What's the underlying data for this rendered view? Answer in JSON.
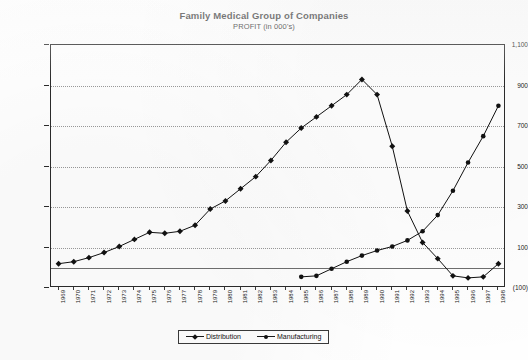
{
  "chart_data": {
    "type": "line",
    "title": "Family Medical Group of Companies",
    "subtitle": "PROFIT (in 000's)",
    "xlabel": "",
    "ylabel": "",
    "ylim": [
      -100,
      1100
    ],
    "ytick_values": [
      1100,
      900,
      700,
      500,
      300,
      100,
      -100
    ],
    "ytick_labels": [
      "1,100",
      "900",
      "700",
      "500",
      "300",
      "100",
      "(100)"
    ],
    "grid": true,
    "legend_position": "bottom-center",
    "categories": [
      "1969",
      "1970",
      "1971",
      "1972",
      "1973",
      "1974",
      "1975",
      "1976",
      "1977",
      "1978",
      "1979",
      "1980",
      "1981",
      "1982",
      "1983",
      "1984",
      "1985",
      "1986",
      "1987",
      "1988",
      "1989",
      "1990",
      "1991",
      "1992",
      "1993",
      "1994",
      "1995",
      "1996",
      "1997",
      "1998"
    ],
    "series": [
      {
        "name": "Distribution",
        "marker": "diamond",
        "color": "#111111",
        "values": [
          20,
          30,
          50,
          75,
          105,
          140,
          175,
          170,
          180,
          210,
          290,
          330,
          390,
          450,
          530,
          620,
          690,
          745,
          800,
          855,
          930,
          855,
          600,
          280,
          125,
          45,
          -40,
          -50,
          -45,
          20
        ]
      },
      {
        "name": "Manufacturing",
        "marker": "circle",
        "color": "#111111",
        "values": [
          null,
          null,
          null,
          null,
          null,
          null,
          null,
          null,
          null,
          null,
          null,
          null,
          null,
          null,
          null,
          null,
          -45,
          -40,
          -5,
          30,
          60,
          85,
          105,
          135,
          180,
          260,
          380,
          520,
          650,
          800
        ]
      }
    ]
  },
  "legend": {
    "items": [
      {
        "label": "Distribution"
      },
      {
        "label": "Manufacturing"
      }
    ]
  }
}
